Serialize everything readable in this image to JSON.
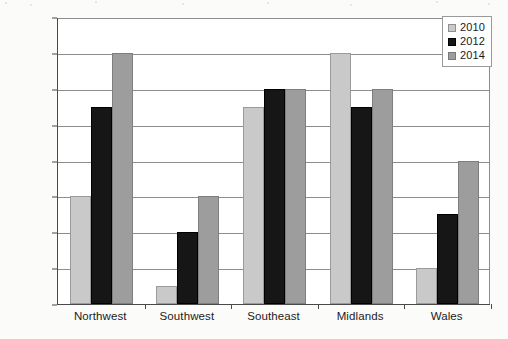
{
  "chart_data": {
    "type": "bar",
    "title": "",
    "subtitle": "",
    "xlabel": "",
    "ylabel": "",
    "categories": [
      "Northwest",
      "Southwest",
      "Southeast",
      "Midlands",
      "Wales"
    ],
    "series": [
      {
        "name": "2010",
        "color": "#c9c9c9",
        "values": [
          30000,
          5000,
          55000,
          70000,
          10000
        ]
      },
      {
        "name": "2012",
        "color": "#161616",
        "values": [
          55000,
          20000,
          60000,
          55000,
          25000
        ]
      },
      {
        "name": "2014",
        "color": "#9d9d9d",
        "values": [
          70000,
          30000,
          60000,
          60000,
          40000
        ]
      }
    ],
    "ylim": [
      0,
      80000
    ],
    "ytick_step": 10000,
    "ytick_labels": [
      "0",
      "10,000",
      "20,000",
      "30,000",
      "40,000",
      "50,000",
      "60,000",
      "70,000",
      "80,000"
    ],
    "ytick_values": [
      0,
      10000,
      20000,
      30000,
      40000,
      50000,
      60000,
      70000,
      80000
    ],
    "grid": true,
    "grid_axis": "y",
    "legend_position": "top-right",
    "legend_entries": [
      "2010",
      "2012",
      "2014"
    ],
    "bar_grouping": "grouped"
  }
}
